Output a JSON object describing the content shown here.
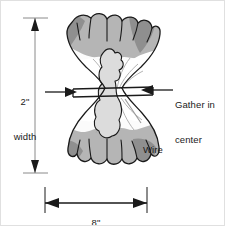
{
  "figure": {
    "background_color": "#ffffff",
    "border_color": "#e0e0e0",
    "ink_color": "#1a1a1a"
  },
  "dimensions": {
    "width": {
      "value": "2\"",
      "unit_label": "width",
      "orientation": "vertical",
      "arrow_style": "double-ended"
    },
    "length": {
      "value": "8\"",
      "unit_label": "length",
      "orientation": "horizontal",
      "arrow_style": "double-ended"
    }
  },
  "callouts": [
    {
      "name": "gather-in-center",
      "line1": "Gather in",
      "line2": "center",
      "pointer": "double-arrow-inward"
    },
    {
      "name": "wire",
      "line1": "Wire",
      "line2": "",
      "pointer": "leader-line"
    }
  ],
  "artwork": {
    "fill_light": "#f2f2f2",
    "fill_mid": "#b5b5b5",
    "fill_dark": "#8f8f8f",
    "fill_white": "#ffffff",
    "outline": "#1a1a1a",
    "leader_gray": "#9a9a9a",
    "description": "Hourglass shaped tissue bundle with ruffled fringed top and bottom, pinched and bound at the center by a wire"
  },
  "colors": {
    "ink": "#1a1a1a",
    "mid_gray": "#b5b5b5",
    "dark_gray": "#8f8f8f",
    "light_gray": "#d8d8d8",
    "border": "#e0e0e0"
  }
}
